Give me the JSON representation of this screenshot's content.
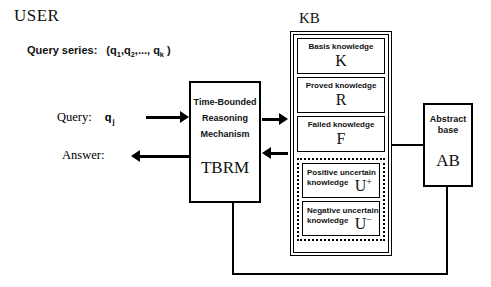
{
  "diagram": {
    "user_section": {
      "title": "USER",
      "query_series_label": "Query series:",
      "query_series_open": "(q",
      "query_series_sub1": "1",
      "query_series_mid1": ",q",
      "query_series_sub2": "2",
      "query_series_mid2": ",...,",
      "query_series_q3": "q",
      "query_series_sub3": "k",
      "query_series_close": ")",
      "query_label": "Query:",
      "query_value": "q",
      "query_value_sub": "j",
      "answer_label": "Answer:"
    },
    "tbrm": {
      "line1": "Time-Bounded",
      "line2": "Reasoning",
      "line3": "Mechanism",
      "acronym": "TBRM"
    },
    "kb": {
      "title": "KB",
      "cells": [
        {
          "caption": "Basis knowledge",
          "symbol": "K"
        },
        {
          "caption": "Proved knowledge",
          "symbol": "R"
        },
        {
          "caption": "Failed knowledge",
          "symbol": "F"
        }
      ],
      "uncertain": [
        {
          "caption_line1": "Positive uncertain",
          "caption_line2": "knowledge",
          "symbol": "U",
          "superscript": "+"
        },
        {
          "caption_line1": "Negative uncertain",
          "caption_line2": "knowledge",
          "symbol": "U",
          "superscript": "−"
        }
      ]
    },
    "abstract_base": {
      "caption_line1": "Abstract",
      "caption_line2": "base",
      "acronym": "AB"
    },
    "colors": {
      "stroke": "#000000",
      "background": "#ffffff",
      "text": "#111111"
    }
  }
}
